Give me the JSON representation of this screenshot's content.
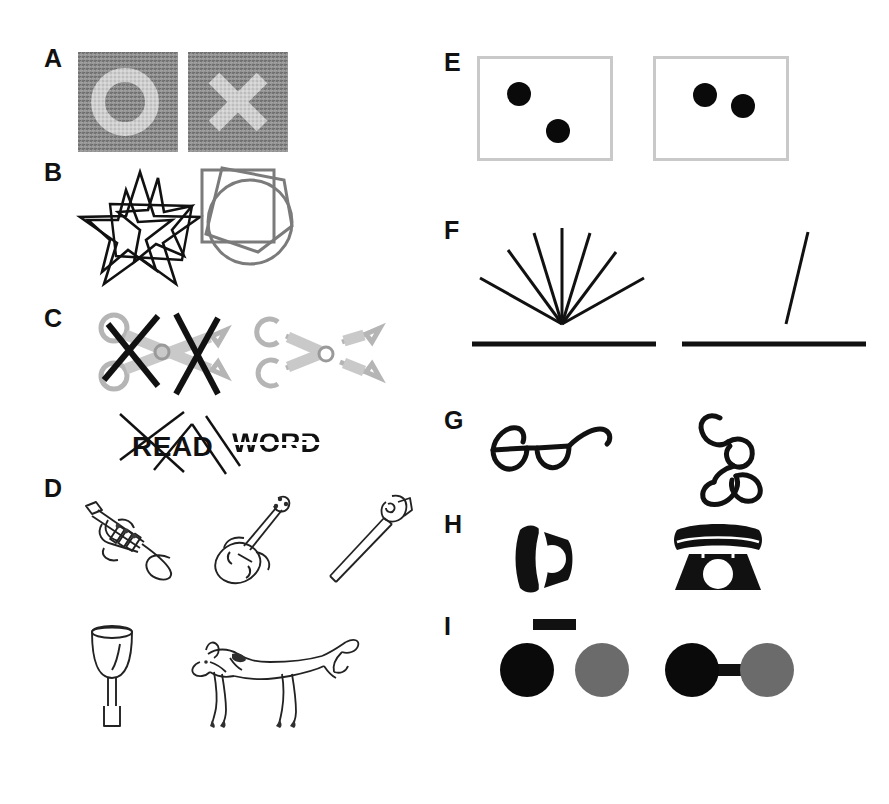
{
  "figure": {
    "background_color": "#ffffff",
    "width": 889,
    "height": 804,
    "colors": {
      "ink_black": "#111111",
      "pure_black": "#000000",
      "gray_shape": "#777777",
      "gray_circle": "#6b6b6b",
      "noise_base": "#8a8a8a",
      "noise_figure": "#c8c8c8",
      "box_border": "#c9c9c9"
    }
  },
  "panels": [
    {
      "id": "A",
      "label": "A",
      "description": "Shapes embedded in visual noise",
      "left_stimulus": "noise-square-with-letter-O",
      "right_stimulus": "noise-square-with-letter-X",
      "embedded_shapes": [
        "O",
        "X"
      ]
    },
    {
      "id": "B",
      "label": "B",
      "description": "Overlapping line figures",
      "left_stimulus": "overlapping-stars-black",
      "right_stimulus": "overlapping-geometric-shapes-gray",
      "left_shapes": [
        "star",
        "star",
        "star"
      ],
      "right_shapes": [
        "square",
        "pentagon",
        "circle"
      ]
    },
    {
      "id": "C",
      "label": "C",
      "description": "Occluded and fragmented objects and words",
      "left_stimulus": "scissors-with-occluders",
      "right_stimulus": "scissors-fragmented",
      "word_left": "READ",
      "word_right": "WORD",
      "word_left_condition": "occluded-by-lines",
      "word_right_condition": "fragmented-deleted"
    },
    {
      "id": "D",
      "label": "D",
      "description": "Line drawings of objects and a chimeric animal",
      "objects": [
        "trumpet",
        "violin",
        "saw",
        "wine-glass",
        "chimeric-horse-goat"
      ]
    },
    {
      "id": "E",
      "label": "E",
      "description": "Two dots in a frame at differing spatial arrangements",
      "left_stimulus": "two-dots-diagonal",
      "right_stimulus": "two-dots-horizontal",
      "dot_count": 2
    },
    {
      "id": "F",
      "label": "F",
      "description": "Line orientation relative to a horizontal reference",
      "left_stimulus": "fan-of-seven-lines-above-baseline",
      "right_stimulus": "single-tilted-line-above-baseline",
      "fan_line_count": 7
    },
    {
      "id": "G",
      "label": "G",
      "description": "Object in canonical versus unusual viewpoint",
      "left_stimulus": "eyeglasses-canonical-view",
      "right_stimulus": "eyeglasses-unusual-view"
    },
    {
      "id": "H",
      "label": "H",
      "description": "Silhouette in rotated versus upright orientation",
      "left_stimulus": "telephone-silhouette-rotated",
      "right_stimulus": "telephone-silhouette-upright"
    },
    {
      "id": "I",
      "label": "I",
      "description": "Uniform connectedness grouping",
      "left_stimulus": "two-circles-unconnected-with-separate-bar",
      "right_stimulus": "two-circles-connected-by-bar"
    }
  ]
}
